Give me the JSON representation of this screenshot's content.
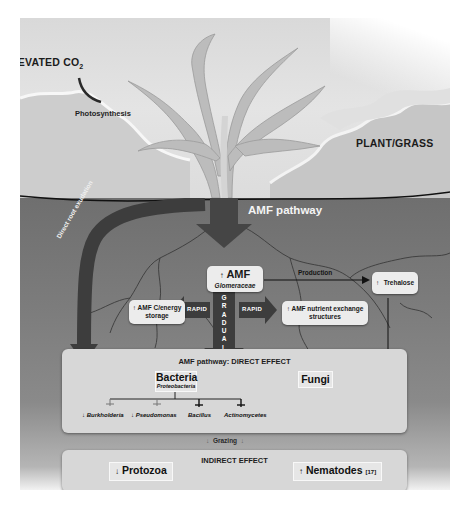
{
  "sky": {
    "co2_label": "ELEVATED CO",
    "co2_subscript": "2",
    "photosynthesis_label": "Photosynthesis",
    "plant_label": "PLANT/GRASS"
  },
  "soil": {
    "pathway_title": "AMF pathway",
    "root_exudation_label": "Direct root exudation",
    "amf_box": {
      "arrow": "↑",
      "title": "AMF",
      "subtitle": "Glomeraceae"
    },
    "production_label": "Production",
    "trehalose_box": {
      "arrow": "↑",
      "label": "Trehalose"
    },
    "storage_box": {
      "arrow": "↑",
      "label_line1": "AMF C/energy",
      "label_line2": "storage"
    },
    "nutrient_box": {
      "arrow": "↑",
      "label_line1": "AMF nutrient exchange",
      "label_line2": "structures"
    },
    "rapid_left_label": "RAPID",
    "rapid_right_label": "RAPID",
    "gradual_letters": [
      "G",
      "R",
      "A",
      "D",
      "U",
      "A",
      "L"
    ]
  },
  "direct_effect": {
    "title": "AMF pathway: DIRECT EFFECT",
    "bacteria": {
      "title": "Bacteria",
      "subtitle": "Proteobacteria"
    },
    "fungi": {
      "title": "Fungi"
    },
    "genera": [
      {
        "arrow": "↓",
        "name": "Burkholderia"
      },
      {
        "arrow": "↓",
        "name": "Pseudomonas"
      },
      {
        "arrow": "",
        "name": "Bacillus"
      },
      {
        "arrow": "",
        "name": "Actinomycetes"
      }
    ]
  },
  "grazing": {
    "label": "Grazing",
    "arrow": "↓"
  },
  "indirect_effect": {
    "title": "INDIRECT EFFECT",
    "protozoa": {
      "arrow": "↓",
      "label": "Protozoa"
    },
    "nematodes": {
      "arrow": "↑",
      "label": "Nematodes",
      "citation": "[17]"
    }
  },
  "colors": {
    "sky": "#dcdcdc",
    "soil": "#767676",
    "arrow_dark": "#3a3a3a",
    "panel": "#d7d7d7",
    "bubble": "#ececec",
    "text_dark": "#1b1b1b",
    "text_light": "#f4f4f4"
  }
}
